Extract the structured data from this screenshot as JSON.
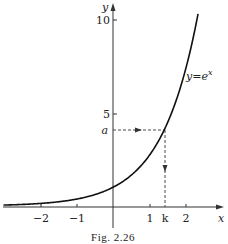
{
  "chart_data": {
    "type": "line",
    "title": "",
    "caption": "Fig. 2.26",
    "xlabel": "x",
    "ylabel": "y",
    "xlim": [
      -3,
      2.6
    ],
    "ylim": [
      -0.6,
      10.8
    ],
    "x_ticks": [
      {
        "value": -2,
        "label": "−2"
      },
      {
        "value": -1,
        "label": "−1"
      },
      {
        "value": 1,
        "label": "1"
      },
      {
        "value": 2,
        "label": "2"
      }
    ],
    "y_ticks": [
      {
        "value": 5,
        "label": "5"
      },
      {
        "value": 10,
        "label": "10"
      }
    ],
    "series": [
      {
        "name": "y=e^x",
        "function": "exp(x)",
        "x_range": [
          -3,
          2.33
        ]
      }
    ],
    "annotations": [
      {
        "type": "curve-label",
        "text": "y=e",
        "superscript": "x"
      },
      {
        "type": "y-marker",
        "label": "a",
        "value": 4.1
      },
      {
        "type": "x-marker",
        "label": "k",
        "value": 1.41
      }
    ],
    "grid": false,
    "legend": "none"
  },
  "labels": {
    "x_axis": "x",
    "y_axis": "y",
    "curve_main": "y=e",
    "curve_sup": "x",
    "a": "a",
    "k": "k",
    "tick_x_m2": "−2",
    "tick_x_m1": "−1",
    "tick_x_1": "1",
    "tick_x_2": "2",
    "tick_y_5": "5",
    "tick_y_10": "10",
    "caption": "Fig. 2.26"
  }
}
